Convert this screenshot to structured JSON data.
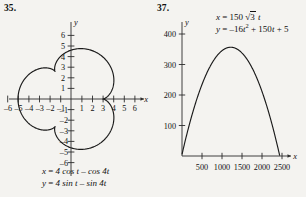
{
  "page": {
    "background": "#f4f3f0",
    "ink": "#111111"
  },
  "figures": [
    {
      "number": "35.",
      "equations": [
        {
          "lhs": "x",
          "rhs": "4 cos t – cos 4t"
        },
        {
          "lhs": "y",
          "rhs": "4 sin t – sin 4t"
        }
      ],
      "axis_labels": {
        "x": "x",
        "y": "y"
      },
      "chart_data": {
        "type": "line",
        "title": "",
        "xlabel": "x",
        "ylabel": "y",
        "grid": false,
        "legend": "none",
        "xlim": [
          -6.8,
          6.8
        ],
        "ylim": [
          -6.8,
          6.8
        ],
        "xticks": [
          -6,
          -5,
          -4,
          -3,
          -2,
          -1,
          1,
          2,
          3,
          4,
          5,
          6
        ],
        "yticks": [
          6,
          5,
          4,
          3,
          2,
          1,
          -1,
          -2,
          -3,
          -4,
          -5,
          -6
        ],
        "xtick_labels": [
          "–6",
          "–5",
          "–4",
          "–3",
          "–2",
          "–1",
          "1",
          "2",
          "3",
          "4",
          "5",
          "6"
        ],
        "ytick_labels": [
          "6",
          "5",
          "4",
          "3",
          "2",
          "1",
          "–1",
          "–2",
          "–3",
          "–4",
          "–5",
          "–6"
        ],
        "parametric": {
          "x_expr": "4*cos(t) - cos(4*t)",
          "y_expr": "4*sin(t) - sin(4*t)",
          "t_range": [
            0,
            6.283185307179586
          ],
          "samples": 720
        },
        "annotations": [
          {
            "text": "cusp",
            "x": 3,
            "y": 0
          },
          {
            "text": "cusp",
            "x": -1.5,
            "y": 2.598
          },
          {
            "text": "cusp",
            "x": -1.5,
            "y": -2.598
          }
        ]
      }
    },
    {
      "number": "37.",
      "equations": [
        {
          "lhs": "x",
          "rhs": "150 √3 t"
        },
        {
          "lhs": "y",
          "rhs": "–16t² + 150t + 5"
        }
      ],
      "axis_labels": {
        "x": "x",
        "y": "y"
      },
      "chart_data": {
        "type": "line",
        "title": "",
        "xlabel": "x",
        "ylabel": "y",
        "grid": false,
        "legend": "none",
        "xlim": [
          0,
          2650
        ],
        "ylim": [
          0,
          430
        ],
        "xticks": [
          500,
          1000,
          1500,
          2000,
          2500
        ],
        "yticks": [
          100,
          200,
          300,
          400
        ],
        "xtick_labels": [
          "500",
          "1000",
          "1500",
          "2000",
          "2500"
        ],
        "ytick_labels": [
          "100",
          "200",
          "300",
          "400"
        ],
        "parametric": {
          "x_expr": "150*sqrt(3)*t",
          "y_expr": "-16*t^2 + 150*t + 5",
          "t_range": [
            0,
            9.4
          ],
          "samples": 400
        },
        "vertex": {
          "x": 1217,
          "y": 356
        },
        "x_intercept": {
          "x": 2437,
          "y": 0
        },
        "y_intercept": {
          "x": 0,
          "y": 5
        }
      }
    }
  ]
}
